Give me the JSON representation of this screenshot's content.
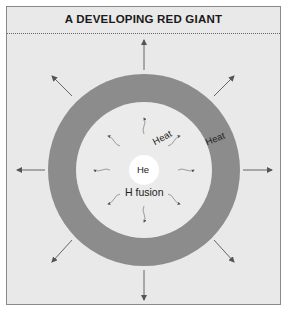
{
  "title": "A DEVELOPING RED GIANT",
  "labels": {
    "core": "He",
    "shell": "H fusion",
    "heat_inner": "Heat",
    "heat_outer": "Heat"
  },
  "colors": {
    "background": "#e9e9e9",
    "envelope_ring": "#8c8c8c",
    "core": "#ffffff",
    "arrows": "#666666"
  }
}
